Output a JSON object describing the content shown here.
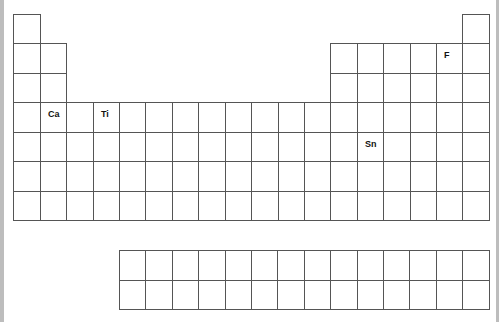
{
  "diagram": {
    "type": "periodic-table-blank",
    "grid": {
      "origin_x": 13,
      "origin_y": 14,
      "col_positions": [
        13,
        40,
        66,
        93,
        119,
        145,
        172,
        198,
        225,
        251,
        278,
        304,
        330,
        357,
        383,
        410,
        436,
        462,
        489
      ],
      "row_positions": [
        14,
        43,
        73,
        102,
        132,
        161,
        191,
        220
      ]
    },
    "main_rows": [
      {
        "row": 1,
        "columns": [
          1,
          18
        ]
      },
      {
        "row": 2,
        "columns": [
          1,
          2,
          13,
          14,
          15,
          16,
          17,
          18
        ]
      },
      {
        "row": 3,
        "columns": [
          1,
          2,
          13,
          14,
          15,
          16,
          17,
          18
        ]
      },
      {
        "row": 4,
        "columns": [
          1,
          2,
          3,
          4,
          5,
          6,
          7,
          8,
          9,
          10,
          11,
          12,
          13,
          14,
          15,
          16,
          17,
          18
        ]
      },
      {
        "row": 5,
        "columns": [
          1,
          2,
          3,
          4,
          5,
          6,
          7,
          8,
          9,
          10,
          11,
          12,
          13,
          14,
          15,
          16,
          17,
          18
        ]
      },
      {
        "row": 6,
        "columns": [
          1,
          2,
          3,
          4,
          5,
          6,
          7,
          8,
          9,
          10,
          11,
          12,
          13,
          14,
          15,
          16,
          17,
          18
        ]
      },
      {
        "row": 7,
        "columns": [
          1,
          2,
          3,
          4,
          5,
          6,
          7,
          8,
          9,
          10,
          11,
          12,
          13,
          14,
          15,
          16,
          17,
          18
        ]
      }
    ],
    "f_block": {
      "left": 119,
      "top": 250,
      "cols": 14,
      "rows": 2,
      "col_width": 26.4,
      "row_height": 29.5
    },
    "labels": [
      {
        "symbol": "Ca",
        "row": 4,
        "col": 2
      },
      {
        "symbol": "Ti",
        "row": 4,
        "col": 4
      },
      {
        "symbol": "F",
        "row": 2,
        "col": 17
      },
      {
        "symbol": "Sn",
        "row": 5,
        "col": 14
      }
    ],
    "colors": {
      "line": "#555555",
      "edge": "#bdbdbd",
      "label": "#111111",
      "background": "#ffffff"
    }
  }
}
